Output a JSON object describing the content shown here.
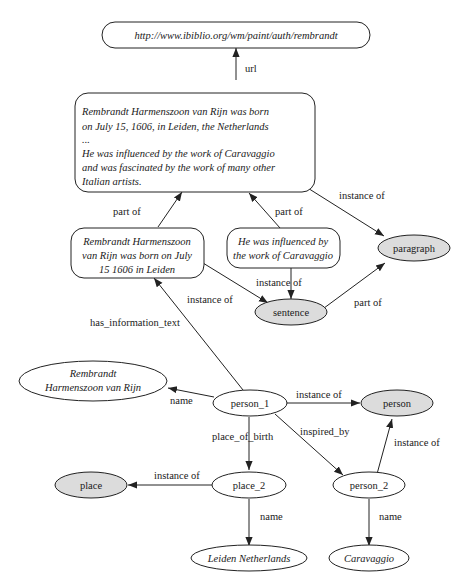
{
  "diagram": {
    "colors": {
      "class_node_fill": "#dcdcdc",
      "instance_node_fill": "#ffffff",
      "stroke": "#222222"
    },
    "nodes": {
      "url": {
        "label": "http://www.ibiblio.org/wm/paint/auth/rembrandt",
        "shape": "rounded-rect"
      },
      "paragraph_text": {
        "shape": "rounded-rect",
        "lines": [
          "Rembrandt Harmenszoon van Rijn was born",
          "on July 15, 1606, in Leiden, the Netherlands",
          "...",
          "He was influenced by the work of Caravaggio",
          "and was fascinated by the work of many other",
          "Italian artists."
        ]
      },
      "sentence1_text": {
        "shape": "rounded-rect",
        "lines": [
          "Rembrandt Harmenszoon",
          "van Rijn was born on July",
          "15 1606 in Leiden"
        ]
      },
      "sentence2_text": {
        "shape": "rounded-rect",
        "lines": [
          "He was influenced by",
          "the work of Caravaggio"
        ]
      },
      "paragraph": {
        "label": "paragraph",
        "shape": "ellipse",
        "class": true
      },
      "sentence": {
        "label": "sentence",
        "shape": "ellipse",
        "class": true
      },
      "rembrandt_name": {
        "shape": "ellipse",
        "lines": [
          "Rembrandt",
          "Harmenszoon van Rijn"
        ]
      },
      "person_1": {
        "label": "person_1",
        "shape": "ellipse"
      },
      "person": {
        "label": "person",
        "shape": "ellipse",
        "class": true
      },
      "place": {
        "label": "place",
        "shape": "ellipse",
        "class": true
      },
      "place_2": {
        "label": "place_2",
        "shape": "ellipse"
      },
      "person_2": {
        "label": "person_2",
        "shape": "ellipse"
      },
      "leiden": {
        "label": "Leiden Netherlands",
        "shape": "ellipse"
      },
      "caravaggio": {
        "label": "Caravaggio",
        "shape": "ellipse"
      }
    },
    "edges": [
      {
        "from": "paragraph_text",
        "to": "url",
        "label": "url"
      },
      {
        "from": "paragraph_text",
        "to": "paragraph",
        "label": "instance of"
      },
      {
        "from": "sentence1_text",
        "to": "paragraph_text",
        "label": "part of"
      },
      {
        "from": "sentence2_text",
        "to": "paragraph_text",
        "label": "part of"
      },
      {
        "from": "sentence2_text",
        "to": "sentence",
        "label": "instance of"
      },
      {
        "from": "sentence1_text",
        "to": "sentence",
        "label": "instance of"
      },
      {
        "from": "sentence",
        "to": "paragraph",
        "label": "part of"
      },
      {
        "from": "person_1",
        "to": "sentence1_text",
        "label": "has_information_text"
      },
      {
        "from": "person_1",
        "to": "rembrandt_name",
        "label": "name"
      },
      {
        "from": "person_1",
        "to": "person",
        "label": "instance of"
      },
      {
        "from": "person_1",
        "to": "place_2",
        "label": "place_of_birth"
      },
      {
        "from": "person_1",
        "to": "person_2",
        "label": "inspired_by"
      },
      {
        "from": "person_2",
        "to": "person",
        "label": "instance of"
      },
      {
        "from": "place_2",
        "to": "place",
        "label": "instance of"
      },
      {
        "from": "place_2",
        "to": "leiden",
        "label": "name"
      },
      {
        "from": "person_2",
        "to": "caravaggio",
        "label": "name"
      }
    ]
  }
}
